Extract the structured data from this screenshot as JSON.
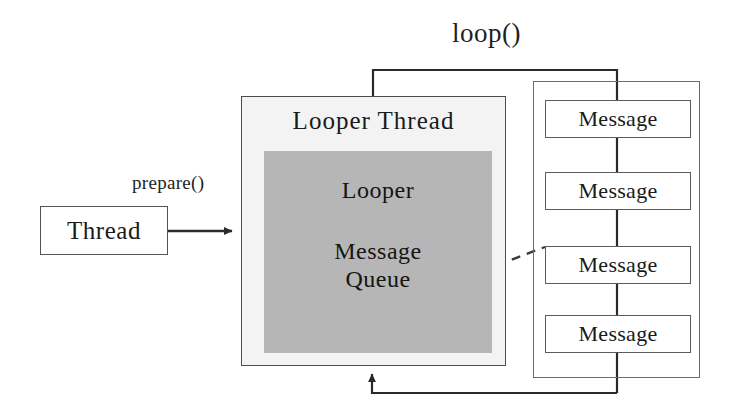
{
  "diagram": {
    "colors": {
      "stroke": "#545454",
      "queue_fill": "#b6b6b6",
      "thread_fill": "#f3f3f3",
      "background": "#ffffff"
    },
    "nodes": {
      "thread": {
        "label": "Thread"
      },
      "looper_thread": {
        "title": "Looper Thread",
        "looper_label": "Looper",
        "queue_label_line1": "Message",
        "queue_label_line2": "Queue"
      }
    },
    "messages": [
      {
        "label": "Message"
      },
      {
        "label": "Message"
      },
      {
        "label": "Message"
      },
      {
        "label": "Message"
      }
    ],
    "edges": {
      "prepare_label": "prepare()",
      "loop_label": "loop()"
    }
  }
}
